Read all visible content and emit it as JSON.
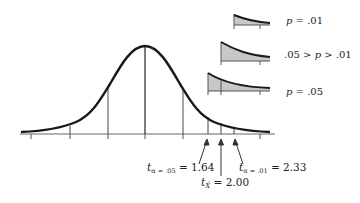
{
  "figure": {
    "colors": {
      "curve": "#1a1a1a",
      "axis": "#555555",
      "shade": "#c8c8c8",
      "text": "#222222"
    }
  },
  "insets": [
    {
      "id": "p-01",
      "p_symbol": "p",
      "label_rest": " = .01",
      "label_full": "p = .01"
    },
    {
      "id": "p-between",
      "label_pre": ".05 > ",
      "p_symbol": "p",
      "label_post": " > .01",
      "label_full": ".05 > p > .01"
    },
    {
      "id": "p-05",
      "p_symbol": "p",
      "label_rest": " = .05",
      "label_full": "p = .05"
    }
  ],
  "critical_values": [
    {
      "t": "t",
      "sub": "α = .05",
      "eq": " = 1.64",
      "value": 1.64
    },
    {
      "t": "t",
      "sub": "X̄",
      "eq": " = 2.00",
      "value": 2.0
    },
    {
      "t": "t",
      "sub": "α = .01",
      "eq": " = 2.33",
      "value": 2.33
    }
  ]
}
